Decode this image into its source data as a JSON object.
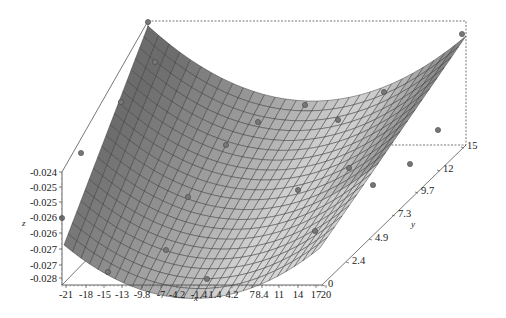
{
  "chart_data": {
    "type": "surface3d",
    "title": "",
    "xlabel": "x",
    "ylabel": "y",
    "zlabel": "z",
    "x_ticks": [
      "-21",
      "-18",
      "-15",
      "-13",
      "-9.8",
      "-7",
      "-4.2",
      "-1.4",
      "1.4",
      "4.2",
      "7",
      "8.4",
      "11",
      "14",
      "17",
      "20"
    ],
    "y_ticks": [
      "0",
      "2.4",
      "4.9",
      "7.3",
      "9.7",
      "12",
      "15"
    ],
    "z_ticks": [
      "-0.024",
      "-0.025",
      "-0.025",
      "-0.026",
      "-0.026",
      "-0.027",
      "-0.027",
      "-0.028"
    ],
    "xlim": [
      -21,
      20
    ],
    "ylim": [
      0,
      15
    ],
    "zlim": [
      -0.0283,
      -0.0236
    ],
    "surface": "quadratic bowl in x (minimum near x≈0), rising toward y=15; gray shaded mesh with dark grid lines",
    "grid_resolution": [
      30,
      20
    ],
    "scatter_points_count": 18,
    "colors": {
      "surface_dark": "#5a5a5a",
      "surface_light": "#d8d8d8",
      "mesh": "#333333",
      "frame": "#555555",
      "point": "#777777"
    },
    "grid": false,
    "legend": null
  }
}
